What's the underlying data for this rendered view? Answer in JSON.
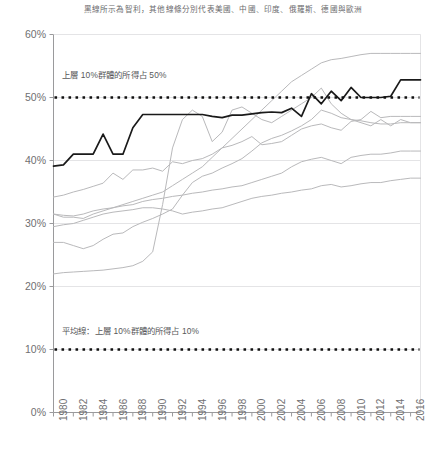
{
  "title": "黑線所示為智利，其他線條分別代表美國、中國、印度、俄羅斯、德國與歐洲",
  "annotations": {
    "top_decile_50": "上層 10%群體的所得占 50%",
    "average_line_10": "平均線：上層 10%群體的所得占 10%"
  },
  "colors": {
    "highlight_line": "#1a1a1a",
    "other_lines": "#b9b9bb",
    "grid": "#e4e4e6",
    "axis": "#9a9a9c",
    "text": "#6f6f71",
    "annotation_text": "#58585a"
  },
  "chart_data": {
    "type": "line",
    "title": "黑線所示為智利，其他線條分別代表美國、中國、印度、俄羅斯、德國與歐洲",
    "xlabel": "",
    "ylabel": "",
    "xlim": [
      1980,
      2017
    ],
    "ylim": [
      0,
      60
    ],
    "ytick_labels": [
      "60%",
      "50%",
      "40%",
      "30%",
      "20%",
      "10%",
      "0%"
    ],
    "ytick_values": [
      60,
      50,
      40,
      30,
      20,
      10,
      0
    ],
    "xtick_labels": [
      "1980",
      "1982",
      "1984",
      "1986",
      "1988",
      "1990",
      "1992",
      "1994",
      "1996",
      "1998",
      "2000",
      "2002",
      "2004",
      "2006",
      "2008",
      "2010",
      "2012",
      "2014",
      "2016"
    ],
    "xtick_values": [
      1980,
      1982,
      1984,
      1986,
      1988,
      1990,
      1992,
      1994,
      1996,
      1998,
      2000,
      2002,
      2004,
      2006,
      2008,
      2010,
      2012,
      2014,
      2016
    ],
    "grid": true,
    "legend_position": "none",
    "x": [
      1980,
      1981,
      1982,
      1983,
      1984,
      1985,
      1986,
      1987,
      1988,
      1989,
      1990,
      1991,
      1992,
      1993,
      1994,
      1995,
      1996,
      1997,
      1998,
      1999,
      2000,
      2001,
      2002,
      2003,
      2004,
      2005,
      2006,
      2007,
      2008,
      2009,
      2010,
      2011,
      2012,
      2013,
      2014,
      2015,
      2016,
      2017
    ],
    "series": [
      {
        "name": "智利",
        "highlight": true,
        "values": [
          39.1,
          39.3,
          41.0,
          41.0,
          41.0,
          44.2,
          41.0,
          41.0,
          45.2,
          47.3,
          47.3,
          47.3,
          47.3,
          47.3,
          47.3,
          47.3,
          47.0,
          46.8,
          47.2,
          47.2,
          47.4,
          47.6,
          47.7,
          47.6,
          48.3,
          47.0,
          50.6,
          49.0,
          51.0,
          49.5,
          51.6,
          50.0,
          50.0,
          50.0,
          50.2,
          52.8,
          52.8,
          52.8
        ]
      },
      {
        "name": "美國",
        "highlight": false,
        "values": [
          34.2,
          34.5,
          35.0,
          35.4,
          35.9,
          36.4,
          38.0,
          37.0,
          38.5,
          38.5,
          38.8,
          38.3,
          39.8,
          39.5,
          40.0,
          40.3,
          41.0,
          42.0,
          42.4,
          43.0,
          43.8,
          42.5,
          42.7,
          43.0,
          44.0,
          45.0,
          45.5,
          45.8,
          45.2,
          44.8,
          46.2,
          46.5,
          47.8,
          46.8,
          47.0,
          47.0,
          47.0,
          47.0
        ]
      },
      {
        "name": "中國",
        "highlight": false,
        "values": [
          27.0,
          27.0,
          26.5,
          26.0,
          26.5,
          27.5,
          28.3,
          28.5,
          29.5,
          30.2,
          30.8,
          31.5,
          32.3,
          34.5,
          36.5,
          37.5,
          38.0,
          38.8,
          39.5,
          40.3,
          41.5,
          42.8,
          43.5,
          44.0,
          44.7,
          45.5,
          46.5,
          48.0,
          47.5,
          46.8,
          46.5,
          46.3,
          46.0,
          45.8,
          45.8,
          46.0,
          46.0,
          46.0
        ]
      },
      {
        "name": "印度",
        "highlight": false,
        "values": [
          31.5,
          31.0,
          31.0,
          30.8,
          31.5,
          32.0,
          32.5,
          33.0,
          33.5,
          34.0,
          34.5,
          35.0,
          36.0,
          37.0,
          38.0,
          39.0,
          40.5,
          42.0,
          43.5,
          45.0,
          46.5,
          48.0,
          49.5,
          51.0,
          52.5,
          53.5,
          54.5,
          55.5,
          56.0,
          56.2,
          56.5,
          56.8,
          57.0,
          57.0,
          57.0,
          57.0,
          57.0,
          57.0
        ]
      },
      {
        "name": "俄羅斯",
        "highlight": false,
        "values": [
          22.0,
          22.2,
          22.3,
          22.4,
          22.5,
          22.6,
          22.8,
          23.0,
          23.3,
          24.0,
          25.5,
          33.0,
          42.0,
          46.5,
          48.0,
          47.0,
          43.0,
          44.5,
          48.0,
          48.5,
          47.5,
          46.5,
          46.0,
          47.0,
          48.0,
          49.0,
          50.0,
          51.5,
          49.0,
          47.5,
          46.5,
          46.0,
          45.5,
          46.5,
          45.5,
          46.5,
          46.0,
          46.0
        ]
      },
      {
        "name": "德國",
        "highlight": false,
        "values": [
          31.5,
          31.3,
          31.2,
          31.5,
          32.0,
          32.3,
          32.5,
          32.8,
          33.0,
          33.5,
          33.8,
          34.0,
          34.3,
          34.5,
          34.8,
          35.0,
          35.3,
          35.5,
          35.8,
          36.0,
          36.5,
          37.0,
          37.5,
          38.0,
          39.0,
          39.8,
          40.2,
          40.5,
          40.0,
          39.5,
          40.5,
          40.8,
          41.0,
          41.0,
          41.2,
          41.5,
          41.5,
          41.5
        ]
      },
      {
        "name": "歐洲",
        "highlight": false,
        "values": [
          29.5,
          29.8,
          30.0,
          30.5,
          31.0,
          31.5,
          31.8,
          32.0,
          32.2,
          32.5,
          32.5,
          32.3,
          32.0,
          31.5,
          31.8,
          32.0,
          32.3,
          32.5,
          33.0,
          33.5,
          34.0,
          34.3,
          34.5,
          34.8,
          35.0,
          35.3,
          35.5,
          36.0,
          36.2,
          35.8,
          36.0,
          36.3,
          36.5,
          36.5,
          36.8,
          37.0,
          37.2,
          37.2
        ]
      }
    ],
    "reference_lines": [
      {
        "name": "top-decile-50",
        "value": 50,
        "style": "dotted",
        "label": "上層 10%群體的所得占 50%"
      },
      {
        "name": "average-10",
        "value": 10,
        "style": "dotted",
        "label": "平均線：上層 10%群體的所得占 10%"
      }
    ]
  }
}
